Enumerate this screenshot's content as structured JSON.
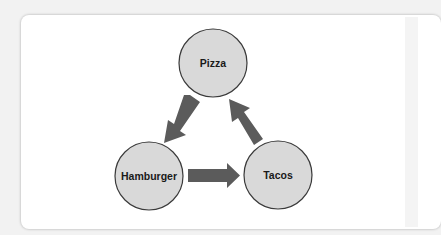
{
  "diagram": {
    "title": "",
    "nodes": [
      {
        "id": "pizza",
        "label": "Pizza",
        "cx": 213,
        "cy": 63,
        "r": 34
      },
      {
        "id": "hamburger",
        "label": "Hamburger",
        "cx": 149,
        "cy": 176,
        "r": 34
      },
      {
        "id": "tacos",
        "label": "Tacos",
        "cx": 278,
        "cy": 175,
        "r": 34
      }
    ],
    "edges": [
      {
        "from": "pizza",
        "to": "hamburger"
      },
      {
        "from": "hamburger",
        "to": "tacos"
      },
      {
        "from": "tacos",
        "to": "pizza"
      }
    ],
    "colors": {
      "node_fill": "#d9d9d9",
      "node_stroke": "#3a3a3a",
      "arrow_fill": "#5b5b5b",
      "label_color": "#1a1a1a",
      "panel_bg": "#ffffff"
    }
  }
}
